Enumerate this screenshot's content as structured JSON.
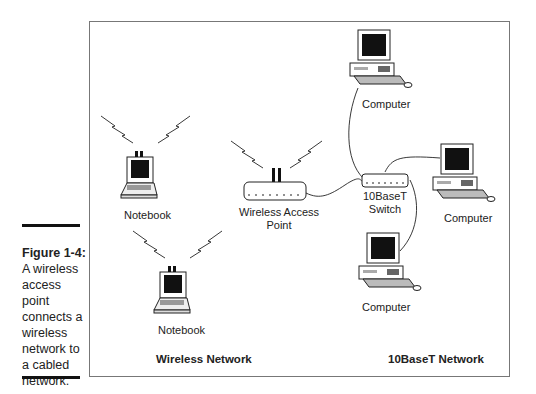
{
  "caption": {
    "figure": "Figure 1-4:",
    "text": "A wireless access point connects a wireless network to a cabled network."
  },
  "diagram": {
    "nodes": [
      {
        "id": "nb1",
        "label": "Notebook",
        "type": "laptop-wireless"
      },
      {
        "id": "nb2",
        "label": "Notebook",
        "type": "laptop-wireless"
      },
      {
        "id": "wap",
        "label": "Wireless Access Point",
        "type": "access-point"
      },
      {
        "id": "sw",
        "label": "10BaseT Switch",
        "type": "switch"
      },
      {
        "id": "pc1",
        "label": "Computer",
        "type": "desktop"
      },
      {
        "id": "pc2",
        "label": "Computer",
        "type": "desktop"
      },
      {
        "id": "pc3",
        "label": "Computer",
        "type": "desktop"
      }
    ],
    "edges": [
      [
        "wap",
        "sw"
      ],
      [
        "sw",
        "pc1"
      ],
      [
        "sw",
        "pc2"
      ],
      [
        "sw",
        "pc3"
      ]
    ],
    "labels": {
      "nb1": "Notebook",
      "nb2": "Notebook",
      "wap_line1": "Wireless Access",
      "wap_line2": "Point",
      "sw_line1": "10BaseT",
      "sw_line2": "Switch",
      "pc1": "Computer",
      "pc2": "Computer",
      "pc3": "Computer"
    },
    "groups": {
      "wireless": "Wireless Network",
      "wired": "10BaseT Network"
    }
  }
}
